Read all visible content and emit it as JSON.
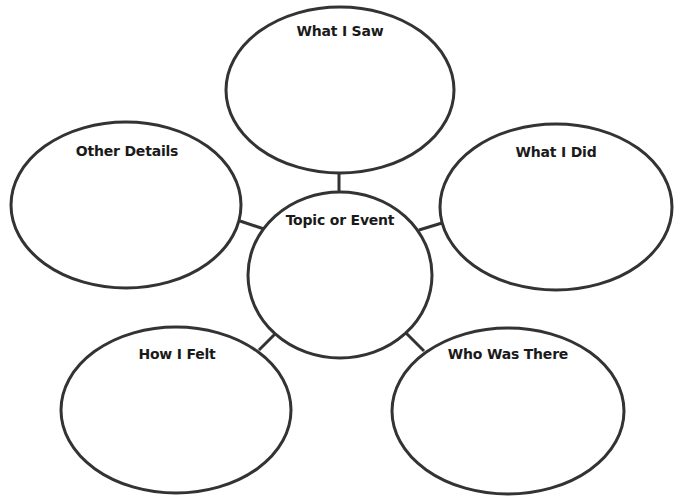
{
  "diagram": {
    "type": "web-organizer",
    "stroke_color": "#333333",
    "background": "#ffffff",
    "center": {
      "label": "Topic or Event"
    },
    "nodes": [
      {
        "id": "what-i-saw",
        "label": "What I Saw"
      },
      {
        "id": "what-i-did",
        "label": "What I Did"
      },
      {
        "id": "who-was-there",
        "label": "Who Was There"
      },
      {
        "id": "how-i-felt",
        "label": "How I Felt"
      },
      {
        "id": "other-details",
        "label": "Other Details"
      }
    ]
  }
}
